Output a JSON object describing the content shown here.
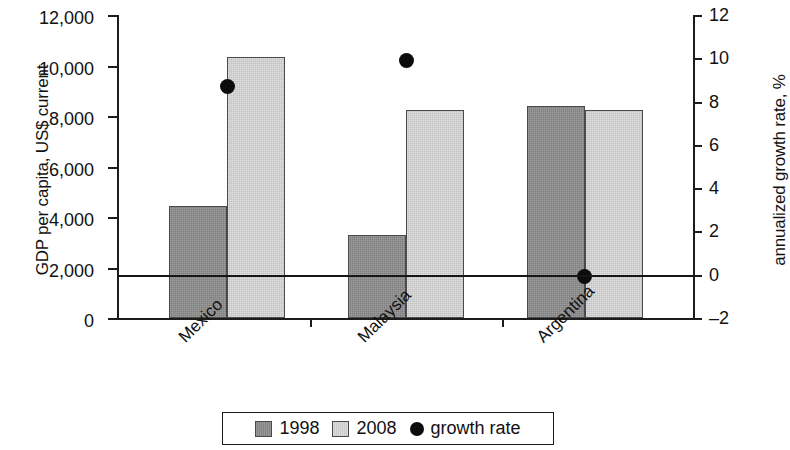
{
  "chart_data": {
    "type": "bar",
    "title": "",
    "subtitle": "",
    "categories": [
      "Mexico",
      "Malaysia",
      "Argentina"
    ],
    "series": [
      {
        "name": "1998",
        "axis": "left",
        "color": "#8f8f8f",
        "values": [
          4450,
          3280,
          8400
        ]
      },
      {
        "name": "2008",
        "axis": "left",
        "color": "#d8d8d8",
        "values": [
          10350,
          8250,
          8250
        ]
      },
      {
        "name": "growth rate",
        "axis": "right",
        "type": "scatter",
        "color": "#0c0c0c",
        "values": [
          8.7,
          9.9,
          -0.1
        ]
      }
    ],
    "xlabel": "",
    "ylabel": "GDP per capita, US$ current",
    "y2label": "annualized growth rate, %",
    "ylim": [
      0,
      12000
    ],
    "y2lim": [
      -2,
      12
    ],
    "ytick_labels": [
      "12,000",
      "10,000",
      "8,000",
      "6,000",
      "4,000",
      "2,000",
      "0"
    ],
    "ytick_values": [
      12000,
      10000,
      8000,
      6000,
      4000,
      2000,
      0
    ],
    "y2tick_labels": [
      "12",
      "10",
      "8",
      "6",
      "4",
      "2",
      "0",
      "–2"
    ],
    "y2tick_values": [
      12,
      10,
      8,
      6,
      4,
      2,
      0,
      -2
    ],
    "grid": false,
    "legend_position": "bottom",
    "legend_entries": [
      "1998",
      "2008",
      "growth rate"
    ]
  },
  "axes": {
    "left_title": "GDP per capita, US$ current",
    "right_title": "annualized growth rate, %"
  },
  "legend": {
    "items": [
      {
        "label": "1998",
        "marker": "square-dark-gray-swatch"
      },
      {
        "label": "2008",
        "marker": "square-light-gray-swatch"
      },
      {
        "label": "growth rate",
        "marker": "black-circle-marker"
      }
    ]
  }
}
